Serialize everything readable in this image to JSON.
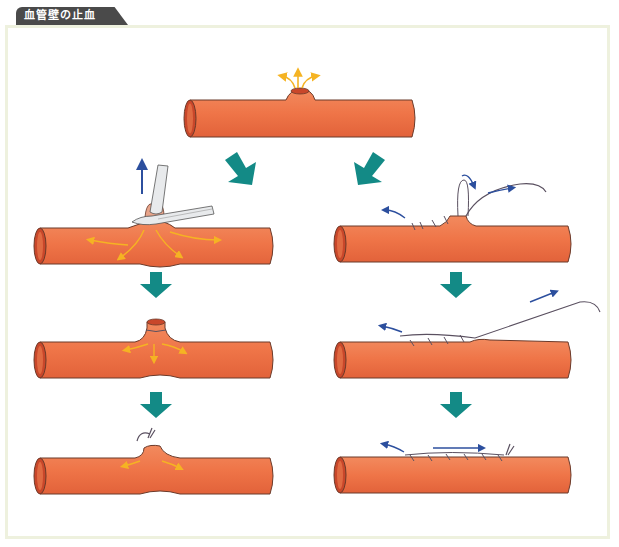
{
  "title": "血管壁の止血",
  "colors": {
    "vessel": "#ef7548",
    "vessel_outline": "#6b3a2a",
    "vessel_lumen": "#c9472a",
    "flow_arrow": "#f5b323",
    "step_arrow": "#138a86",
    "motion_arrow": "#2c4f9e",
    "suture": "#5a5060",
    "frame": "#eef1de",
    "tab": "#4a4a4a"
  },
  "diagram": {
    "top": {
      "name": "damaged-vessel",
      "description": "Vessel wall with hole, blood spurting out"
    },
    "left_column": [
      {
        "step": 1,
        "name": "clamp-with-forceps",
        "description": "Forceps grasp the protrusion and pull upward"
      },
      {
        "step": 2,
        "name": "ligated-bulge",
        "description": "Protrusion tied off, pressure spreads"
      },
      {
        "step": 3,
        "name": "tied-stump",
        "description": "Stump tied with knot"
      }
    ],
    "right_column": [
      {
        "step": 1,
        "name": "start-suturing",
        "description": "Needle and thread stitching the wall"
      },
      {
        "step": 2,
        "name": "continue-suturing",
        "description": "Running suture along the wall"
      },
      {
        "step": 3,
        "name": "suture-complete",
        "description": "Suture finished and tied"
      }
    ]
  }
}
